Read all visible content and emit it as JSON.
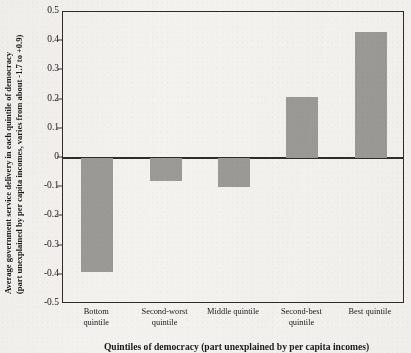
{
  "chart_data": {
    "type": "bar",
    "title": "",
    "categories": [
      "Bottom\nquintile",
      "Second-worst\nquintile",
      "Middle quintile",
      "Second-best\nquintile",
      "Best quintile"
    ],
    "values": [
      -0.39,
      -0.08,
      -0.1,
      0.21,
      0.43
    ],
    "ylabel_line1": "Average government service delivery in each quintile of democracy",
    "ylabel_line2": "(part unexplained by per capita incomes, varies from about -1.7 to +0.9)",
    "xlabel": "Quintiles of democracy (part unexplained by per capita incomes)",
    "ylim": [
      -0.5,
      0.5
    ],
    "yticks": [
      "0.5",
      "0.4",
      "0.3",
      "0.2",
      "0.1",
      "0",
      "-0.1",
      "-0.2",
      "-0.3",
      "-0.4",
      "-0.5"
    ],
    "ytick_values": [
      0.5,
      0.4,
      0.3,
      0.2,
      0.1,
      0,
      -0.1,
      -0.2,
      -0.3,
      -0.4,
      -0.5
    ],
    "grid": false,
    "legend": false,
    "bar_color": "#9b9a97",
    "axis_color": "#2e2b28",
    "background_color": "#f4f2ef"
  }
}
